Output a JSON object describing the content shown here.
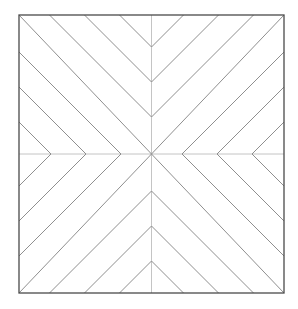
{
  "figure": {
    "name": "square-chevron-line-pattern",
    "canvas": {
      "width": 298,
      "height": 309
    },
    "colors": {
      "background": "#ffffff",
      "border": "#4a4a4a",
      "diagonal": "#8f8f8f",
      "midline": "#c4c4c4"
    },
    "stroke_widths": {
      "border": 1.3,
      "diagonal": 1,
      "midline": 1
    },
    "square": {
      "x": 19,
      "y": 15,
      "width": 265,
      "height": 278
    },
    "midlines": [
      {
        "x1": 151.5,
        "y1": 15,
        "x2": 151.5,
        "y2": 293
      },
      {
        "x1": 19,
        "y1": 154,
        "x2": 284,
        "y2": 154
      }
    ],
    "diagonals": [
      {
        "x1": 19,
        "y1": 15,
        "x2": 284,
        "y2": 293
      },
      {
        "x1": 284,
        "y1": 15,
        "x2": 19,
        "y2": 293
      },
      {
        "x1": 119.5,
        "y1": 15,
        "x2": 151.5,
        "y2": 47
      },
      {
        "x1": 183.5,
        "y1": 15,
        "x2": 151.5,
        "y2": 47
      },
      {
        "x1": 84.5,
        "y1": 15,
        "x2": 151.5,
        "y2": 82
      },
      {
        "x1": 218.5,
        "y1": 15,
        "x2": 151.5,
        "y2": 82
      },
      {
        "x1": 49.5,
        "y1": 15,
        "x2": 151.5,
        "y2": 117
      },
      {
        "x1": 253.5,
        "y1": 15,
        "x2": 151.5,
        "y2": 117
      },
      {
        "x1": 119.5,
        "y1": 293,
        "x2": 151.5,
        "y2": 261
      },
      {
        "x1": 183.5,
        "y1": 293,
        "x2": 151.5,
        "y2": 261
      },
      {
        "x1": 84.5,
        "y1": 293,
        "x2": 151.5,
        "y2": 226
      },
      {
        "x1": 218.5,
        "y1": 293,
        "x2": 151.5,
        "y2": 226
      },
      {
        "x1": 49.5,
        "y1": 293,
        "x2": 151.5,
        "y2": 191
      },
      {
        "x1": 253.5,
        "y1": 293,
        "x2": 151.5,
        "y2": 191
      },
      {
        "x1": 19,
        "y1": 122,
        "x2": 51,
        "y2": 154
      },
      {
        "x1": 19,
        "y1": 186,
        "x2": 51,
        "y2": 154
      },
      {
        "x1": 19,
        "y1": 87,
        "x2": 86,
        "y2": 154
      },
      {
        "x1": 19,
        "y1": 221,
        "x2": 86,
        "y2": 154
      },
      {
        "x1": 19,
        "y1": 52,
        "x2": 121,
        "y2": 154
      },
      {
        "x1": 19,
        "y1": 256,
        "x2": 121,
        "y2": 154
      },
      {
        "x1": 284,
        "y1": 122,
        "x2": 252,
        "y2": 154
      },
      {
        "x1": 284,
        "y1": 186,
        "x2": 252,
        "y2": 154
      },
      {
        "x1": 284,
        "y1": 87,
        "x2": 217,
        "y2": 154
      },
      {
        "x1": 284,
        "y1": 221,
        "x2": 217,
        "y2": 154
      },
      {
        "x1": 284,
        "y1": 52,
        "x2": 182,
        "y2": 154
      },
      {
        "x1": 284,
        "y1": 256,
        "x2": 182,
        "y2": 154
      }
    ]
  }
}
